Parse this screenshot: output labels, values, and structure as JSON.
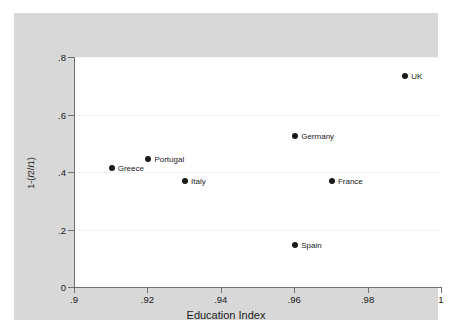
{
  "chart_data": {
    "type": "scatter",
    "title": "",
    "xlabel": "Education Index",
    "ylabel": "1-(I2/I1)",
    "xlim": [
      0.9,
      1.0
    ],
    "ylim": [
      0.0,
      0.8
    ],
    "xticks": [
      ".9",
      ".92",
      ".94",
      ".96",
      ".98",
      "1"
    ],
    "xtick_values": [
      0.9,
      0.92,
      0.94,
      0.96,
      0.98,
      1.0
    ],
    "yticks": [
      "0",
      ".2",
      ".4",
      ".6",
      ".8"
    ],
    "ytick_values": [
      0,
      0.2,
      0.4,
      0.6,
      0.8
    ],
    "grid": "horizontal",
    "legend": "none",
    "points": [
      {
        "label": "Greece",
        "x": 0.91,
        "y": 0.415
      },
      {
        "label": "Portugal",
        "x": 0.92,
        "y": 0.445
      },
      {
        "label": "Italy",
        "x": 0.93,
        "y": 0.367
      },
      {
        "label": "Spain",
        "x": 0.96,
        "y": 0.147
      },
      {
        "label": "Germany",
        "x": 0.96,
        "y": 0.525
      },
      {
        "label": "France",
        "x": 0.97,
        "y": 0.367
      },
      {
        "label": "UK",
        "x": 0.99,
        "y": 0.735
      }
    ],
    "marker_color": "#1a1a1a",
    "plot_background": "#ffffff",
    "canvas_background": "#d8d8d8",
    "axis_color": "#6f6f6f",
    "gridline_color": "#f2f2f2"
  }
}
